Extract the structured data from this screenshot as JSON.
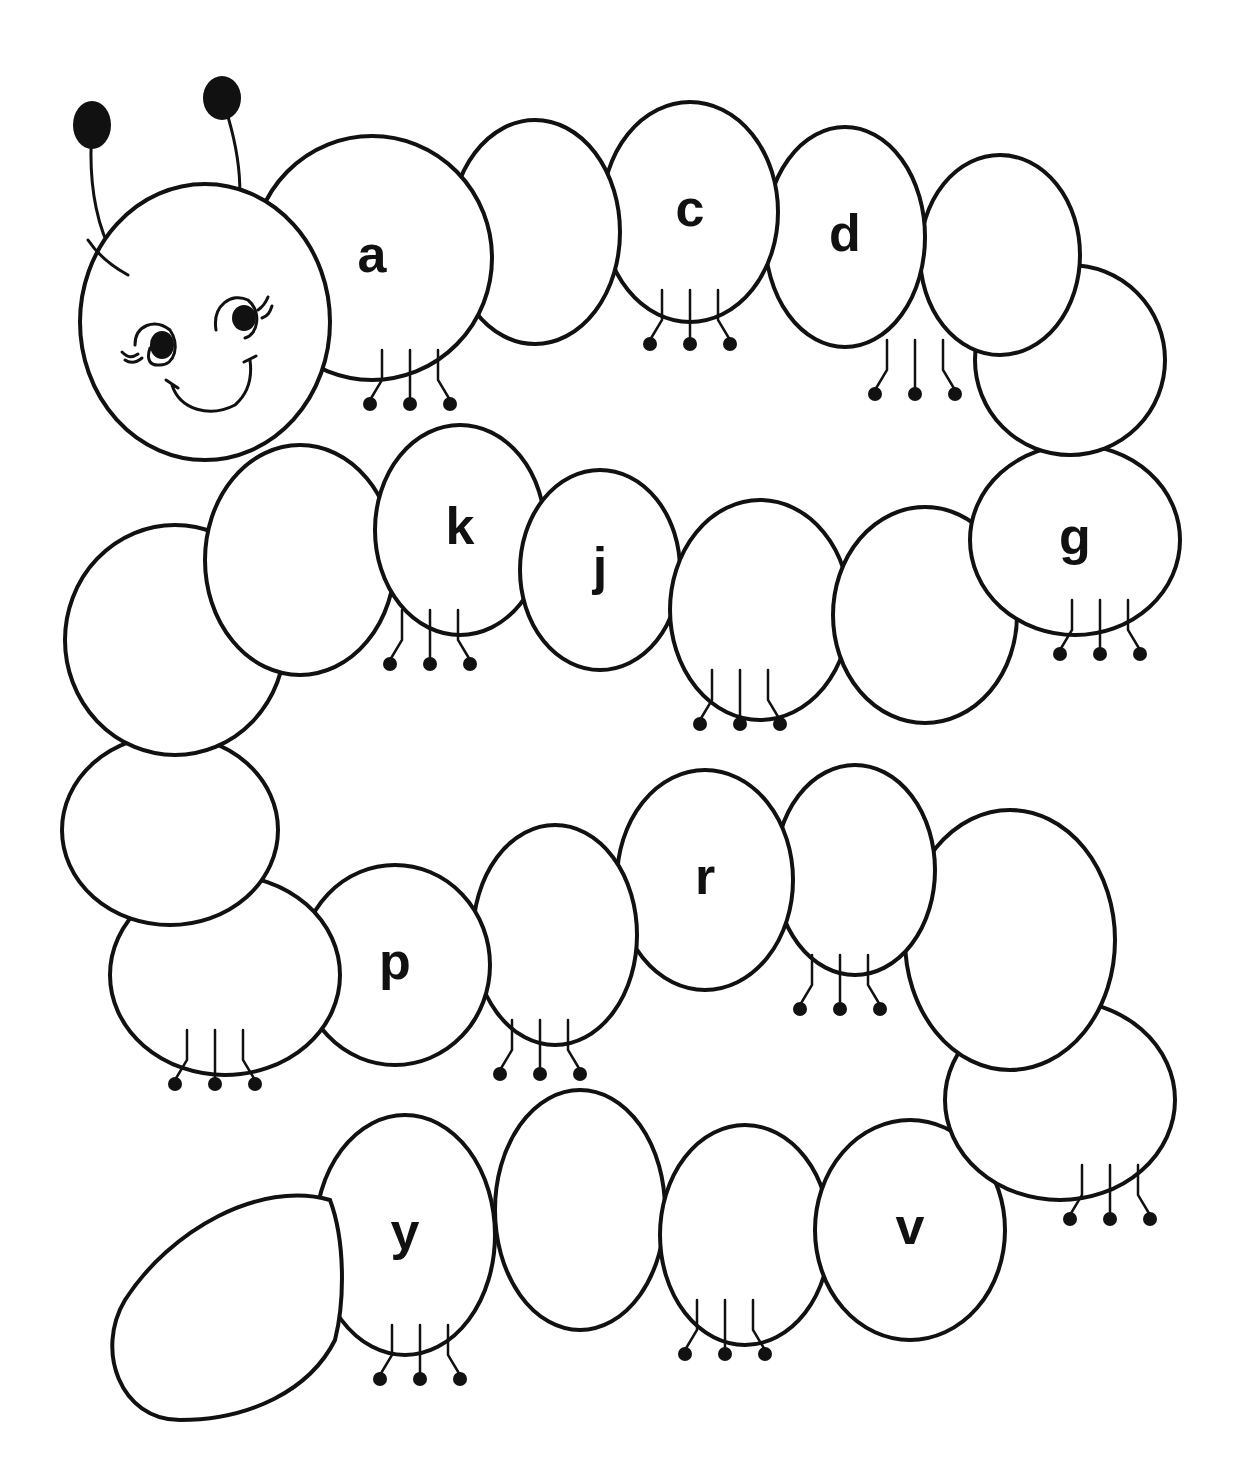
{
  "worksheet": {
    "subject": "caterpillar alphabet worksheet",
    "instructions": "",
    "colors": {
      "line": "#111111",
      "fill": "#ffffff"
    }
  },
  "head": {
    "features": [
      "antenna-left",
      "antenna-right",
      "eye-left",
      "eye-right",
      "smile"
    ]
  },
  "segments": [
    {
      "index": 0,
      "letter_slot": "a",
      "shown": "a",
      "cx": 372,
      "cy": 258,
      "rx": 120,
      "ry": 122
    },
    {
      "index": 1,
      "letter_slot": "b",
      "shown": "",
      "cx": 535,
      "cy": 232,
      "rx": 85,
      "ry": 112
    },
    {
      "index": 2,
      "letter_slot": "c",
      "shown": "c",
      "cx": 690,
      "cy": 212,
      "rx": 88,
      "ry": 110
    },
    {
      "index": 3,
      "letter_slot": "d",
      "shown": "d",
      "cx": 845,
      "cy": 237,
      "rx": 80,
      "ry": 110
    },
    {
      "index": 4,
      "letter_slot": "e",
      "shown": "",
      "cx": 1000,
      "cy": 255,
      "rx": 80,
      "ry": 100
    },
    {
      "index": 5,
      "letter_slot": "f",
      "shown": "",
      "cx": 1070,
      "cy": 360,
      "rx": 95,
      "ry": 95
    },
    {
      "index": 6,
      "letter_slot": "g",
      "shown": "g",
      "cx": 1075,
      "cy": 540,
      "rx": 105,
      "ry": 95
    },
    {
      "index": 7,
      "letter_slot": "h",
      "shown": "",
      "cx": 925,
      "cy": 615,
      "rx": 92,
      "ry": 108
    },
    {
      "index": 8,
      "letter_slot": "i",
      "shown": "",
      "cx": 760,
      "cy": 610,
      "rx": 90,
      "ry": 110
    },
    {
      "index": 9,
      "letter_slot": "j",
      "shown": "j",
      "cx": 600,
      "cy": 570,
      "rx": 80,
      "ry": 100
    },
    {
      "index": 10,
      "letter_slot": "k",
      "shown": "k",
      "cx": 460,
      "cy": 530,
      "rx": 85,
      "ry": 105
    },
    {
      "index": 11,
      "letter_slot": "l",
      "shown": "",
      "cx": 300,
      "cy": 560,
      "rx": 95,
      "ry": 115
    },
    {
      "index": 12,
      "letter_slot": "m",
      "shown": "",
      "cx": 175,
      "cy": 640,
      "rx": 110,
      "ry": 115
    },
    {
      "index": 13,
      "letter_slot": "n",
      "shown": "",
      "cx": 170,
      "cy": 830,
      "rx": 108,
      "ry": 95
    },
    {
      "index": 14,
      "letter_slot": "o",
      "shown": "",
      "cx": 225,
      "cy": 975,
      "rx": 115,
      "ry": 100
    },
    {
      "index": 15,
      "letter_slot": "p",
      "shown": "p",
      "cx": 395,
      "cy": 965,
      "rx": 95,
      "ry": 100
    },
    {
      "index": 16,
      "letter_slot": "q",
      "shown": "",
      "cx": 555,
      "cy": 935,
      "rx": 82,
      "ry": 110
    },
    {
      "index": 17,
      "letter_slot": "r",
      "shown": "r",
      "cx": 705,
      "cy": 880,
      "rx": 88,
      "ry": 110
    },
    {
      "index": 18,
      "letter_slot": "s",
      "shown": "",
      "cx": 855,
      "cy": 870,
      "rx": 80,
      "ry": 105
    },
    {
      "index": 19,
      "letter_slot": "t",
      "shown": "",
      "cx": 1010,
      "cy": 940,
      "rx": 105,
      "ry": 130
    },
    {
      "index": 20,
      "letter_slot": "u",
      "shown": "",
      "cx": 1060,
      "cy": 1100,
      "rx": 115,
      "ry": 100
    },
    {
      "index": 21,
      "letter_slot": "v",
      "shown": "v",
      "cx": 910,
      "cy": 1230,
      "rx": 95,
      "ry": 110
    },
    {
      "index": 22,
      "letter_slot": "w",
      "shown": "",
      "cx": 745,
      "cy": 1235,
      "rx": 85,
      "ry": 110
    },
    {
      "index": 23,
      "letter_slot": "x",
      "shown": "",
      "cx": 580,
      "cy": 1210,
      "rx": 85,
      "ry": 120
    },
    {
      "index": 24,
      "letter_slot": "y",
      "shown": "y",
      "cx": 405,
      "cy": 1235,
      "rx": 90,
      "ry": 120
    }
  ],
  "tail": {
    "letter_slot": "z",
    "shown": ""
  },
  "visible_letters": [
    "a",
    "c",
    "d",
    "g",
    "k",
    "j",
    "p",
    "r",
    "y",
    "v"
  ]
}
